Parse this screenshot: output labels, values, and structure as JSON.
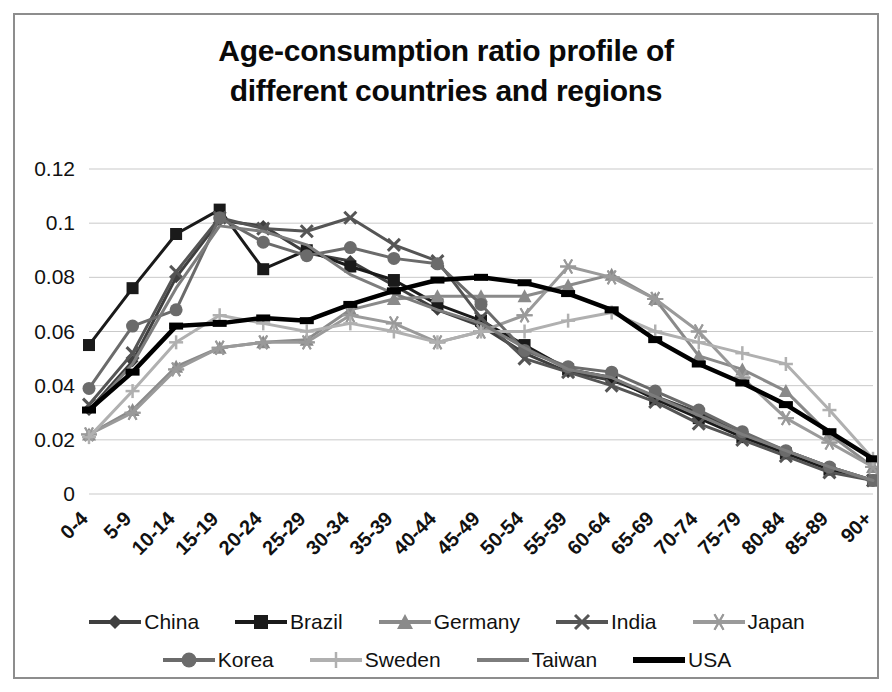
{
  "title_lines": [
    "Age-consumption ratio profile of",
    "different countries and regions"
  ],
  "chart_data": {
    "type": "line",
    "title": "Age-consumption ratio profile of different countries and regions",
    "xlabel": "",
    "ylabel": "",
    "ylim": [
      0,
      0.12
    ],
    "yticks": [
      "0",
      "0.02",
      "0.04",
      "0.06",
      "0.08",
      "0.1",
      "0.12"
    ],
    "ytick_values": [
      0,
      0.02,
      0.04,
      0.06,
      0.08,
      0.1,
      0.12
    ],
    "grid": true,
    "legend_position": "bottom",
    "categories": [
      "0-4",
      "5-9",
      "10-14",
      "15-19",
      "20-24",
      "25-29",
      "30-34",
      "35-39",
      "40-44",
      "45-49",
      "50-54",
      "55-59",
      "60-64",
      "65-69",
      "70-74",
      "75-79",
      "80-84",
      "85-89",
      "90+"
    ],
    "series": [
      {
        "name": "China",
        "marker": "diamond",
        "color": "#3f3f3f",
        "values": [
          0.031,
          0.049,
          0.08,
          0.101,
          0.099,
          0.089,
          0.086,
          0.077,
          0.068,
          0.062,
          0.052,
          0.045,
          0.042,
          0.036,
          0.03,
          0.022,
          0.016,
          0.01,
          0.005
        ]
      },
      {
        "name": "Brazil",
        "marker": "square",
        "color": "#1a1a1a",
        "values": [
          0.055,
          0.076,
          0.096,
          0.105,
          0.083,
          0.09,
          0.084,
          0.079,
          0.07,
          0.064,
          0.055,
          0.046,
          0.043,
          0.035,
          0.028,
          0.021,
          0.015,
          0.009,
          0.005
        ]
      },
      {
        "name": "Germany",
        "marker": "triangle",
        "color": "#8a8a8a",
        "values": [
          0.022,
          0.031,
          0.047,
          0.054,
          0.056,
          0.057,
          0.068,
          0.072,
          0.073,
          0.073,
          0.073,
          0.077,
          0.081,
          0.072,
          0.051,
          0.046,
          0.038,
          0.022,
          0.01
        ]
      },
      {
        "name": "India",
        "marker": "x",
        "color": "#555555",
        "values": [
          0.033,
          0.052,
          0.082,
          0.102,
          0.098,
          0.097,
          0.102,
          0.092,
          0.086,
          0.065,
          0.05,
          0.045,
          0.04,
          0.034,
          0.026,
          0.02,
          0.014,
          0.008,
          0.005
        ]
      },
      {
        "name": "Japan",
        "marker": "star",
        "color": "#9a9a9a",
        "values": [
          0.022,
          0.03,
          0.046,
          0.054,
          0.056,
          0.056,
          0.066,
          0.063,
          0.056,
          0.06,
          0.066,
          0.084,
          0.08,
          0.072,
          0.06,
          0.043,
          0.028,
          0.019,
          0.01
        ]
      },
      {
        "name": "Korea",
        "marker": "circle",
        "color": "#6b6b6b",
        "values": [
          0.039,
          0.062,
          0.068,
          0.102,
          0.093,
          0.088,
          0.091,
          0.087,
          0.085,
          0.07,
          0.053,
          0.047,
          0.045,
          0.038,
          0.031,
          0.023,
          0.016,
          0.01,
          0.005
        ]
      },
      {
        "name": "Sweden",
        "marker": "plus",
        "color": "#b0b0b0",
        "values": [
          0.021,
          0.038,
          0.056,
          0.066,
          0.063,
          0.06,
          0.063,
          0.06,
          0.056,
          0.06,
          0.06,
          0.064,
          0.067,
          0.06,
          0.056,
          0.052,
          0.048,
          0.031,
          0.013
        ]
      },
      {
        "name": "Taiwan",
        "marker": "none",
        "color": "#7d7d7d",
        "values": [
          0.03,
          0.048,
          0.076,
          0.099,
          0.097,
          0.092,
          0.081,
          0.074,
          0.068,
          0.063,
          0.054,
          0.046,
          0.043,
          0.036,
          0.029,
          0.022,
          0.016,
          0.01,
          0.005
        ]
      },
      {
        "name": "USA",
        "marker": "line",
        "color": "#000000",
        "values": [
          0.031,
          0.045,
          0.062,
          0.063,
          0.065,
          0.064,
          0.07,
          0.075,
          0.079,
          0.08,
          0.078,
          0.074,
          0.068,
          0.057,
          0.048,
          0.041,
          0.033,
          0.023,
          0.013
        ]
      }
    ]
  },
  "legend": {
    "rows": [
      [
        "China",
        "Brazil",
        "Germany",
        "India",
        "Japan"
      ],
      [
        "Korea",
        "Sweden",
        "Taiwan",
        "USA"
      ]
    ]
  }
}
